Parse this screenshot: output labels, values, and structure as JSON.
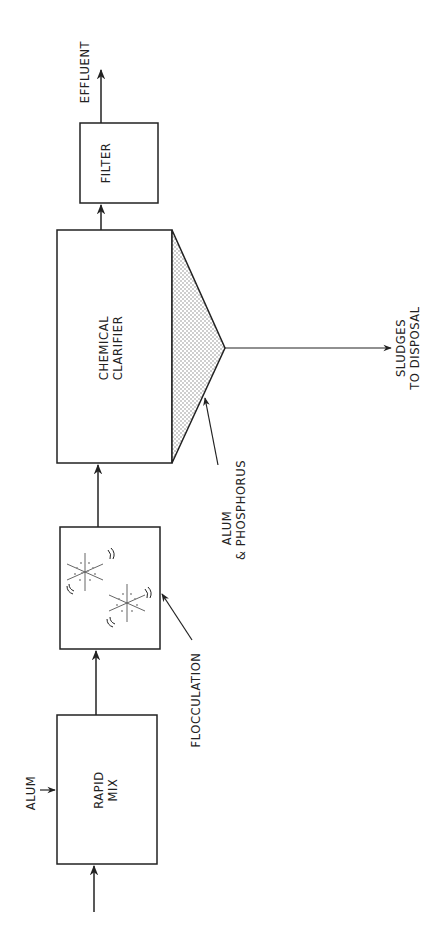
{
  "diagram": {
    "orientation": "rotated 90 degrees counter-clockwise",
    "colors": {
      "line": "#222222",
      "stipple": "#8a8a8a",
      "background": "#ffffff"
    },
    "nodes": {
      "rapid_mix": {
        "line1": "RAPID",
        "line2": "MIX"
      },
      "flocculation": {
        "label": "FLOCCULATION"
      },
      "clarifier": {
        "line1": "CHEMICAL",
        "line2": "CLARIFIER"
      },
      "filter": {
        "label": "FILTER"
      }
    },
    "inputs": {
      "alum": "ALUM"
    },
    "outputs": {
      "effluent": "EFFLUENT",
      "sludge_line1": "SLUDGES",
      "sludge_line2": "TO DISPOSAL"
    },
    "annotations": {
      "hopper_line1": "ALUM",
      "hopper_line2": "& PHOSPHORUS"
    },
    "flow": [
      "influent",
      "RAPID MIX",
      "FLOCCULATION",
      "CHEMICAL CLARIFIER",
      "FILTER",
      "EFFLUENT"
    ]
  }
}
